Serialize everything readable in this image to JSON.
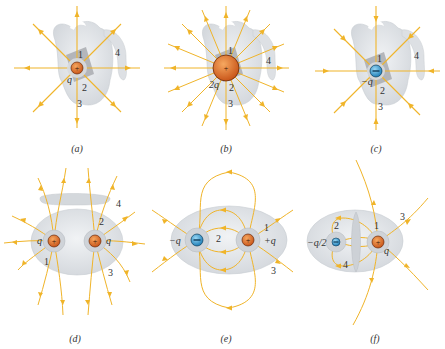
{
  "colors": {
    "field_line": "#f0b429",
    "surface": "#d9dde2",
    "surface_edge": "#c4c8cd",
    "square": "#a9acb0",
    "positive_charge": "#e07a2e",
    "negative_charge": "#3aa0d8",
    "text": "#333333"
  },
  "panels": [
    {
      "id": "a",
      "caption": "(a)",
      "charges": [
        {
          "sign": "+",
          "label": "q"
        }
      ],
      "surface_labels": [
        "1",
        "2",
        "3",
        "4"
      ]
    },
    {
      "id": "b",
      "caption": "(b)",
      "charges": [
        {
          "sign": "+",
          "label": "2q"
        }
      ],
      "surface_labels": [
        "1",
        "2",
        "3",
        "4"
      ]
    },
    {
      "id": "c",
      "caption": "(c)",
      "charges": [
        {
          "sign": "−",
          "label": "−q"
        }
      ],
      "surface_labels": [
        "1",
        "2",
        "3",
        "4"
      ]
    },
    {
      "id": "d",
      "caption": "(d)",
      "charges": [
        {
          "sign": "+",
          "label": "q"
        },
        {
          "sign": "+",
          "label": "q"
        }
      ],
      "surface_labels": [
        "1",
        "2",
        "3",
        "4"
      ]
    },
    {
      "id": "e",
      "caption": "(e)",
      "charges": [
        {
          "sign": "−",
          "label": "−q"
        },
        {
          "sign": "+",
          "label": "+q"
        }
      ],
      "surface_labels": [
        "1",
        "2",
        "3"
      ]
    },
    {
      "id": "f",
      "caption": "(f)",
      "charges": [
        {
          "sign": "−",
          "label": "−q/2"
        },
        {
          "sign": "+",
          "label": "q"
        }
      ],
      "surface_labels": [
        "1",
        "2",
        "3",
        "4"
      ]
    }
  ]
}
